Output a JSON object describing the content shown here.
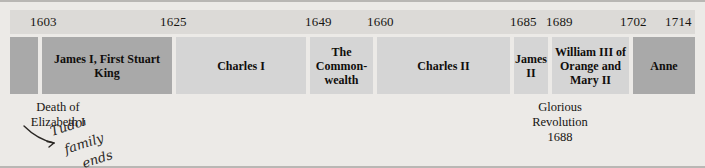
{
  "figure": {
    "name": "stuart-monarchs-timeline",
    "background_color": "#eceae7",
    "shade_dark": "#a9a9a9",
    "shade_light": "#d5d5d5",
    "date_strip_color": "#dcdad7"
  },
  "dates": [
    {
      "label": "1603",
      "x": 20
    },
    {
      "label": "1625",
      "x": 150
    },
    {
      "label": "1649",
      "x": 295
    },
    {
      "label": "1660",
      "x": 357
    },
    {
      "label": "1685",
      "x": 500
    },
    {
      "label": "1689",
      "x": 536
    },
    {
      "label": "1702",
      "x": 610
    },
    {
      "label": "1714",
      "x": 655
    }
  ],
  "reigns": [
    {
      "name": "pre-stuart",
      "label": "",
      "x": 0,
      "width": 28,
      "shade": "dark"
    },
    {
      "name": "james-i",
      "label": "James I,\nFirst Stuart King",
      "x": 32,
      "width": 130,
      "shade": "dark"
    },
    {
      "name": "charles-i",
      "label": "Charles I",
      "x": 166,
      "width": 130,
      "shade": "light"
    },
    {
      "name": "commonwealth",
      "label": "The\nCommon-\nwealth",
      "x": 300,
      "width": 63,
      "shade": "light"
    },
    {
      "name": "charles-ii",
      "label": "Charles II",
      "x": 367,
      "width": 133,
      "shade": "light"
    },
    {
      "name": "james-ii",
      "label": "James\nII",
      "x": 504,
      "width": 34,
      "shade": "light"
    },
    {
      "name": "william-and-mary",
      "label": "William III\nof Orange\nand Mary II",
      "x": 542,
      "width": 77,
      "shade": "light"
    },
    {
      "name": "anne",
      "label": "Anne",
      "x": 623,
      "width": 62,
      "shade": "dark"
    }
  ],
  "annotations": {
    "death_of_elizabeth": "Death of\nElizabeth I",
    "glorious_revolution": "Glorious\nRevolution\n1688",
    "handwritten_note": "Tudor family ends"
  }
}
